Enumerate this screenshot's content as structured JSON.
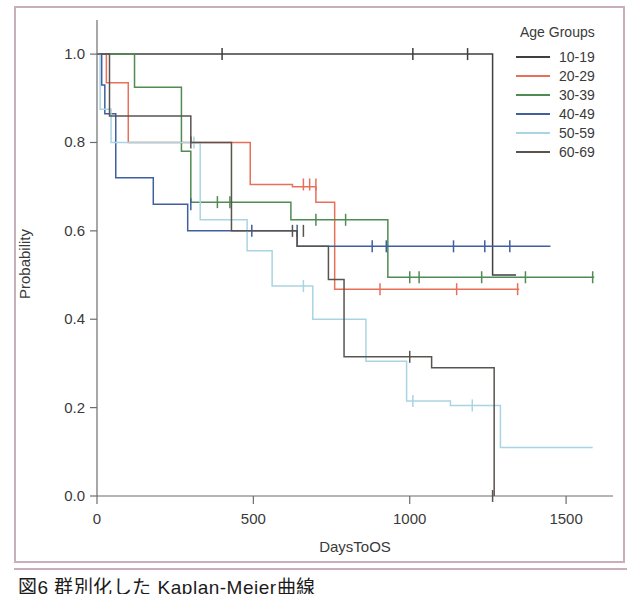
{
  "caption": "図6  群別化した Kaplan-Meier曲線",
  "legend": {
    "title": "Age Groups",
    "entries": [
      {
        "label": "10-19",
        "color": "#3f3f3f"
      },
      {
        "label": "20-29",
        "color": "#e8705a"
      },
      {
        "label": "30-39",
        "color": "#4f8b52"
      },
      {
        "label": "40-49",
        "color": "#3f5fa0"
      },
      {
        "label": "50-59",
        "color": "#a9d4e2"
      },
      {
        "label": "60-69",
        "color": "#5a5450"
      }
    ]
  },
  "chart_data": {
    "type": "line",
    "title": "",
    "subtitle": "",
    "xlabel": "DaysToOS",
    "ylabel": "Probability",
    "xlim": [
      0,
      1650
    ],
    "ylim": [
      0.0,
      1.05
    ],
    "xticks": [
      0,
      500,
      1000,
      1500
    ],
    "xticklabels": [
      "0",
      "500",
      "1000",
      "1500"
    ],
    "yticks": [
      0.0,
      0.2,
      0.4,
      0.6,
      0.8,
      1.0
    ],
    "yticklabels": [
      "0.0",
      "0.2",
      "0.4",
      "0.6",
      "0.8",
      "1.0"
    ],
    "grid": false,
    "legend_position": "top-right-outside",
    "step_style": "post",
    "series": [
      {
        "name": "10-19",
        "color": "#3f3f3f",
        "x": [
          0,
          1265,
          1265,
          1340
        ],
        "y": [
          1.0,
          1.0,
          0.5,
          0.5
        ],
        "censor_x": [
          400,
          1010,
          1185
        ],
        "censor_y": [
          1.0,
          1.0,
          1.0
        ]
      },
      {
        "name": "20-29",
        "color": "#e8705a",
        "x": [
          0,
          30,
          30,
          100,
          100,
          490,
          490,
          625,
          625,
          700,
          700,
          760,
          760,
          1350
        ],
        "y": [
          1.0,
          1.0,
          0.935,
          0.935,
          0.8,
          0.8,
          0.705,
          0.705,
          0.7,
          0.7,
          0.665,
          0.665,
          0.468,
          0.468
        ],
        "censor_x": [
          660,
          680,
          700,
          905,
          1150,
          1345
        ],
        "censor_y": [
          0.705,
          0.705,
          0.705,
          0.468,
          0.468,
          0.468
        ]
      },
      {
        "name": "30-39",
        "color": "#4f8b52",
        "x": [
          0,
          120,
          120,
          270,
          270,
          300,
          300,
          620,
          620,
          930,
          930,
          1590
        ],
        "y": [
          1.0,
          1.0,
          0.925,
          0.925,
          0.78,
          0.78,
          0.665,
          0.665,
          0.625,
          0.625,
          0.495,
          0.495
        ],
        "censor_x": [
          385,
          425,
          700,
          795,
          1000,
          1030,
          1230,
          1370,
          1585
        ],
        "censor_y": [
          0.665,
          0.665,
          0.625,
          0.625,
          0.495,
          0.495,
          0.495,
          0.495,
          0.495
        ]
      },
      {
        "name": "40-49",
        "color": "#3f5fa0",
        "x": [
          0,
          15,
          15,
          25,
          25,
          60,
          60,
          180,
          180,
          290,
          290,
          640,
          640,
          1450
        ],
        "y": [
          1.0,
          1.0,
          0.93,
          0.93,
          0.865,
          0.865,
          0.72,
          0.72,
          0.66,
          0.66,
          0.6,
          0.6,
          0.565,
          0.565
        ],
        "censor_x": [
          300,
          495,
          640,
          880,
          925,
          1140,
          1240,
          1320
        ],
        "censor_y": [
          0.66,
          0.6,
          0.6,
          0.565,
          0.565,
          0.565,
          0.565,
          0.565
        ]
      },
      {
        "name": "50-59",
        "color": "#a9d4e2",
        "x": [
          0,
          10,
          10,
          45,
          45,
          330,
          330,
          480,
          480,
          560,
          560,
          690,
          690,
          860,
          860,
          990,
          990,
          1130,
          1130,
          1290,
          1290,
          1585
        ],
        "y": [
          1.0,
          1.0,
          0.875,
          0.875,
          0.8,
          0.8,
          0.625,
          0.625,
          0.555,
          0.555,
          0.475,
          0.475,
          0.4,
          0.4,
          0.305,
          0.305,
          0.215,
          0.215,
          0.205,
          0.205,
          0.11,
          0.11
        ],
        "censor_x": [
          310,
          660,
          1010,
          1200
        ],
        "censor_y": [
          0.8,
          0.475,
          0.215,
          0.205
        ]
      },
      {
        "name": "60-69",
        "color": "#5a5450",
        "x": [
          0,
          40,
          40,
          300,
          300,
          430,
          430,
          640,
          640,
          740,
          740,
          790,
          790,
          1070,
          1070,
          1270,
          1270
        ],
        "y": [
          1.0,
          1.0,
          0.86,
          0.86,
          0.8,
          0.8,
          0.6,
          0.6,
          0.565,
          0.565,
          0.49,
          0.49,
          0.315,
          0.315,
          0.29,
          0.29,
          0.0
        ],
        "censor_x": [
          300,
          625,
          660,
          1000,
          1265
        ],
        "censor_y": [
          0.8,
          0.6,
          0.6,
          0.315,
          0.0
        ]
      }
    ]
  }
}
